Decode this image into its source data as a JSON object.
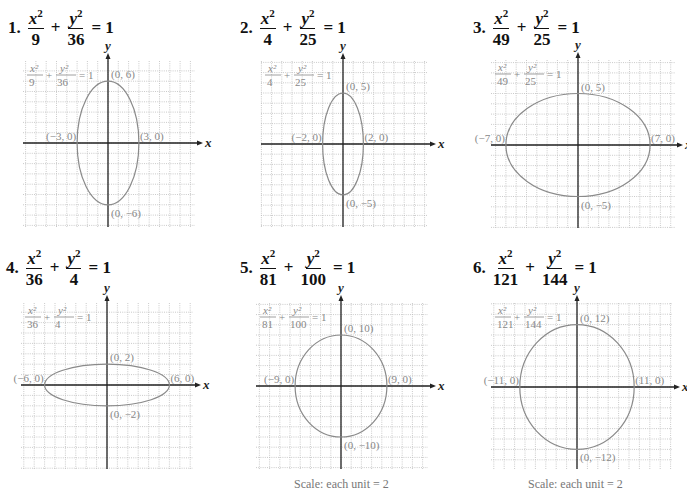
{
  "colors": {
    "grid": "#bdbdbd",
    "axis": "#222222",
    "curve": "#8a8a8a",
    "label": "#888888"
  },
  "problems": [
    {
      "number": "1.",
      "a2": "9",
      "b2": "36",
      "equals": "= 1",
      "labels": {
        "top": "(0, 6)",
        "bottom": "(0, −6)",
        "left": "(−3, 0)",
        "right": "(3, 0)"
      },
      "scale": ""
    },
    {
      "number": "2.",
      "a2": "4",
      "b2": "25",
      "equals": "= 1",
      "labels": {
        "top": "(0, 5)",
        "bottom": "(0, −5)",
        "left": "(−2, 0)",
        "right": "(2, 0)"
      },
      "scale": ""
    },
    {
      "number": "3.",
      "a2": "49",
      "b2": "25",
      "equals": "= 1",
      "labels": {
        "top": "(0, 5)",
        "bottom": "(0, −5)",
        "left": "(−7, 0)",
        "right": "(7, 0)"
      },
      "scale": ""
    },
    {
      "number": "4.",
      "a2": "36",
      "b2": "4",
      "equals": "= 1",
      "labels": {
        "top": "(0, 2)",
        "bottom": "(0, −2)",
        "left": "(−6, 0)",
        "right": "(6, 0)"
      },
      "scale": ""
    },
    {
      "number": "5.",
      "a2": "81",
      "b2": "100",
      "equals": "= 1",
      "labels": {
        "top": "(0, 10)",
        "bottom": "(0, −10)",
        "left": "(−9, 0)",
        "right": "(9, 0)"
      },
      "scale": "Scale:  each unit = 2"
    },
    {
      "number": "6.",
      "a2": "121",
      "b2": "144",
      "equals": "= 1",
      "labels": {
        "top": "(0, 12)",
        "bottom": "(0, −12)",
        "left": "(−11, 0)",
        "right": "(11, 0)"
      },
      "scale": "Scale:  each unit = 2"
    }
  ],
  "axis_labels": {
    "x": "x",
    "y": "y"
  },
  "chart_data": [
    {
      "type": "line",
      "title": "x²/9 + y²/36 = 1",
      "xlabel": "x",
      "ylabel": "y",
      "grid": true,
      "shape": "ellipse",
      "a": 3,
      "b": 6,
      "center": [
        0,
        0
      ],
      "vertices": [
        [
          0,
          6
        ],
        [
          0,
          -6
        ],
        [
          -3,
          0
        ],
        [
          3,
          0
        ]
      ],
      "unit_scale": 1
    },
    {
      "type": "line",
      "title": "x²/4 + y²/25 = 1",
      "xlabel": "x",
      "ylabel": "y",
      "grid": true,
      "shape": "ellipse",
      "a": 2,
      "b": 5,
      "center": [
        0,
        0
      ],
      "vertices": [
        [
          0,
          5
        ],
        [
          0,
          -5
        ],
        [
          -2,
          0
        ],
        [
          2,
          0
        ]
      ],
      "unit_scale": 1
    },
    {
      "type": "line",
      "title": "x²/49 + y²/25 = 1",
      "xlabel": "x",
      "ylabel": "y",
      "grid": true,
      "shape": "ellipse",
      "a": 7,
      "b": 5,
      "center": [
        0,
        0
      ],
      "vertices": [
        [
          0,
          5
        ],
        [
          0,
          -5
        ],
        [
          -7,
          0
        ],
        [
          7,
          0
        ]
      ],
      "unit_scale": 1
    },
    {
      "type": "line",
      "title": "x²/36 + y²/4 = 1",
      "xlabel": "x",
      "ylabel": "y",
      "grid": true,
      "shape": "ellipse",
      "a": 6,
      "b": 2,
      "center": [
        0,
        0
      ],
      "vertices": [
        [
          0,
          2
        ],
        [
          0,
          -2
        ],
        [
          -6,
          0
        ],
        [
          6,
          0
        ]
      ],
      "unit_scale": 1
    },
    {
      "type": "line",
      "title": "x²/81 + y²/100 = 1",
      "xlabel": "x",
      "ylabel": "y",
      "grid": true,
      "shape": "ellipse",
      "a": 9,
      "b": 10,
      "center": [
        0,
        0
      ],
      "vertices": [
        [
          0,
          10
        ],
        [
          0,
          -10
        ],
        [
          -9,
          0
        ],
        [
          9,
          0
        ]
      ],
      "unit_scale": 2,
      "annotation": "Scale: each unit = 2"
    },
    {
      "type": "line",
      "title": "x²/121 + y²/144 = 1",
      "xlabel": "x",
      "ylabel": "y",
      "grid": true,
      "shape": "ellipse",
      "a": 11,
      "b": 12,
      "center": [
        0,
        0
      ],
      "vertices": [
        [
          0,
          12
        ],
        [
          0,
          -12
        ],
        [
          -11,
          0
        ],
        [
          11,
          0
        ]
      ],
      "unit_scale": 2,
      "annotation": "Scale: each unit = 2"
    }
  ]
}
